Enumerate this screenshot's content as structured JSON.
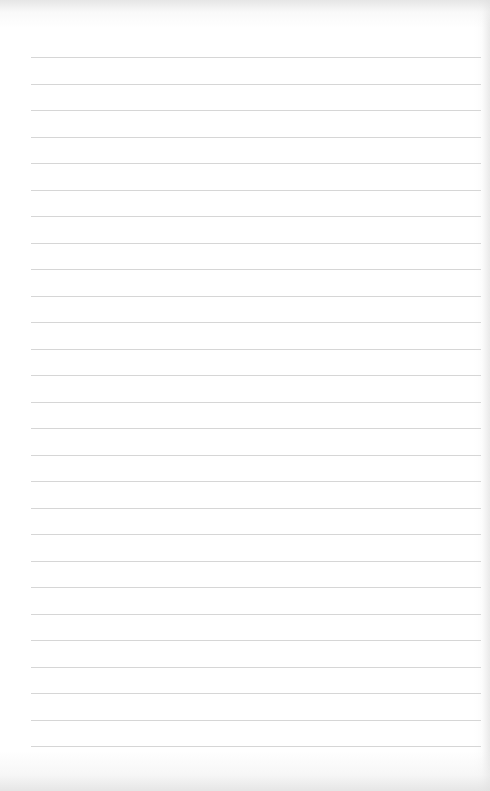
{
  "page": {
    "type": "lined-paper",
    "background_color": "#ffffff",
    "line_color": "#d6d6d6",
    "line_count": 27,
    "first_line_y": 57,
    "line_spacing": 26.5,
    "line_left": 31,
    "line_right": 481
  }
}
